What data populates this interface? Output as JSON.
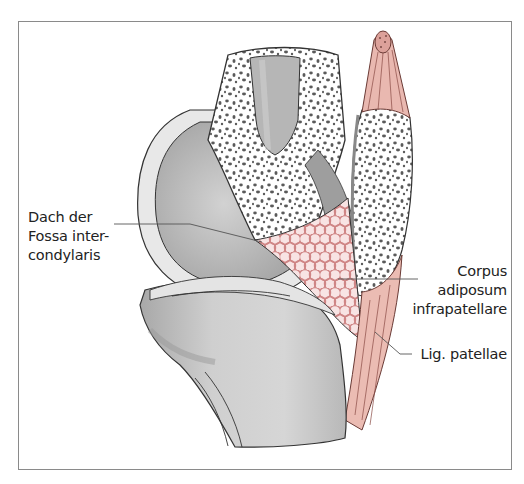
{
  "figure": {
    "type": "anatomical-illustration",
    "colors": {
      "frame": "#8a8a8a",
      "bone_gray": "#c4c4c4",
      "bone_dark": "#a9a9a9",
      "cartilage": "#e6e6e6",
      "spongy_bone": "#ffffff",
      "spongy_dots": "#5a5a5a",
      "ligament": "#e9b8b0",
      "fat_pad": "#f6dcdc",
      "fat_pad_cells": "#c87a7a",
      "outline": "#333333",
      "label_text": "#222222",
      "leader_line": "#555555"
    }
  },
  "labels": {
    "roof_intercondylar": {
      "lines": [
        "Dach der",
        "Fossa inter-",
        "condylaris"
      ]
    },
    "fat_pad": {
      "lines": [
        "Corpus",
        "adiposum",
        "infrapatellare"
      ]
    },
    "patellar_ligament": {
      "lines": [
        "Lig. patellae"
      ]
    }
  }
}
